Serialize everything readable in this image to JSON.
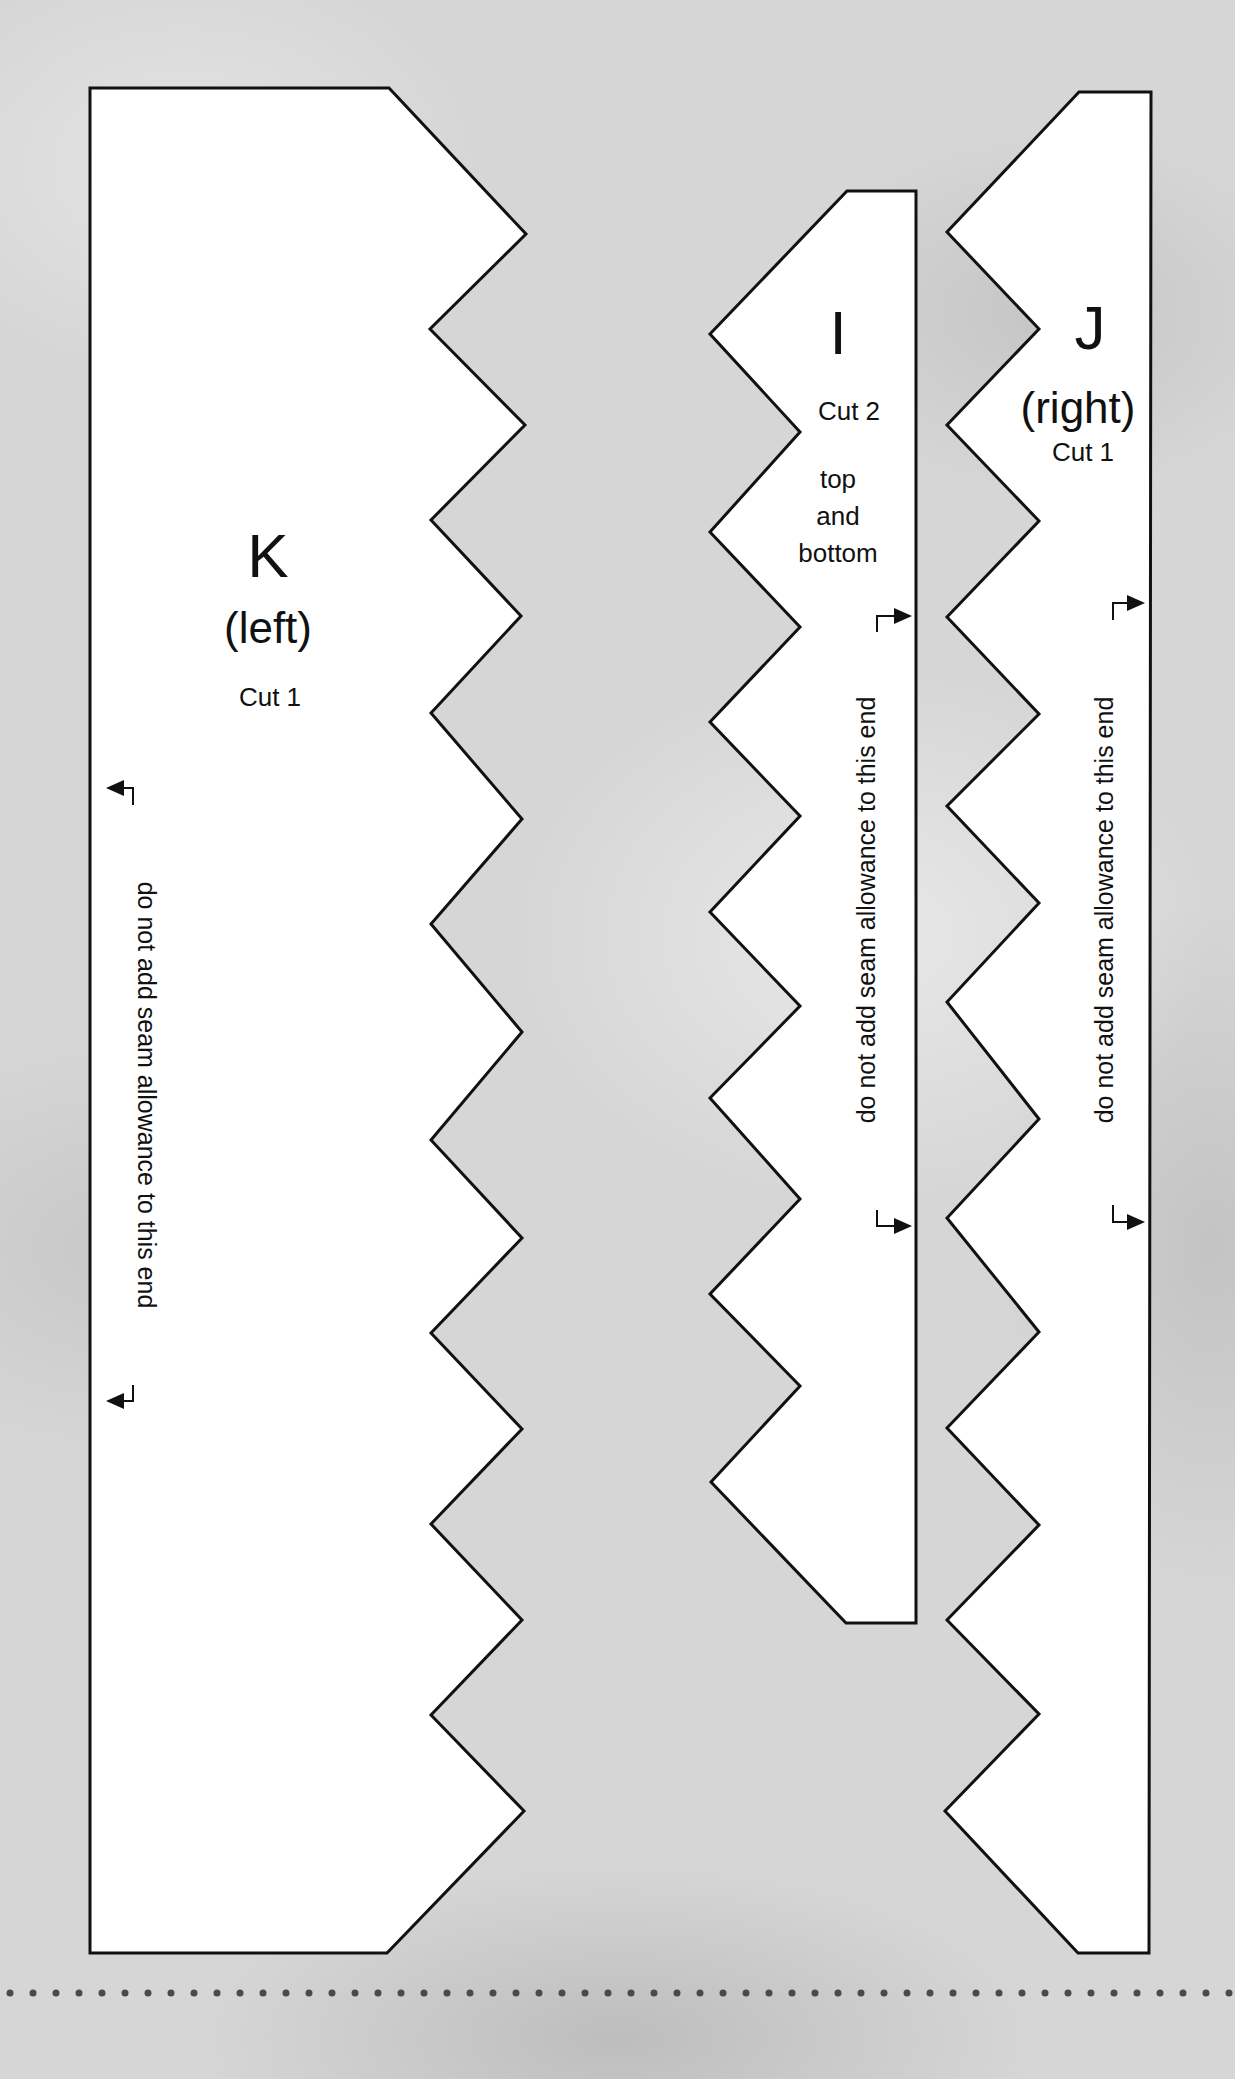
{
  "background": {
    "color": "#d6d6d6",
    "texture": "mottled gray paper"
  },
  "outline_color": "#111111",
  "fill_color": "#ffffff",
  "pieces": {
    "K": {
      "letter": "K",
      "side": "(left)",
      "cut": "Cut 1",
      "note": "do not add seam allowance to this end",
      "note_icon": "bracket-arrow-left-icon"
    },
    "I": {
      "letter": "I",
      "cut": "Cut 2",
      "position_lines": [
        "top",
        "and",
        "bottom"
      ],
      "note": "do not add seam allowance to this end",
      "note_icon": "bracket-arrow-right-icon"
    },
    "J": {
      "letter": "J",
      "side": "(right)",
      "cut": "Cut 1",
      "note": "do not add seam allowance to this end",
      "note_icon": "bracket-arrow-right-icon"
    }
  },
  "divider": {
    "style": "dotted",
    "color": "#4a4a4a"
  }
}
